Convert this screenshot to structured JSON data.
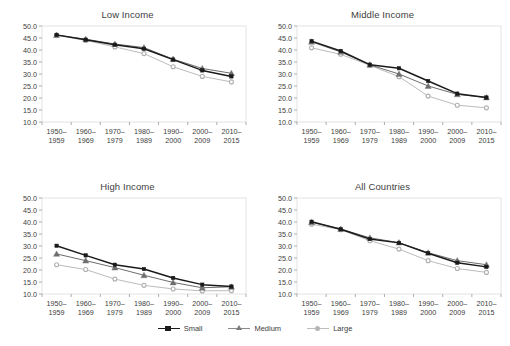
{
  "figure": {
    "panels": [
      "Low Income",
      "Middle Income",
      "High Income",
      "All Countries"
    ]
  },
  "legend": {
    "position": "bottom-center",
    "items": [
      {
        "label": "Small",
        "color": "#1a1a1a",
        "marker": "square"
      },
      {
        "label": "Medium",
        "color": "#808080",
        "marker": "triangle"
      },
      {
        "label": "Large",
        "color": "#b5b5b5",
        "marker": "circle"
      }
    ]
  },
  "chart_data": [
    {
      "type": "line",
      "title": "Low Income",
      "categories": [
        "1950–\n1959",
        "1960–\n1969",
        "1970–\n1979",
        "1980–\n1989",
        "1990–\n2000",
        "2000–\n2009",
        "2010–\n2015"
      ],
      "series": [
        {
          "name": "Small",
          "values": [
            46.3,
            44.3,
            42.2,
            40.5,
            36.0,
            31.5,
            29.0
          ]
        },
        {
          "name": "Medium",
          "values": [
            46.2,
            44.5,
            42.5,
            41.0,
            36.2,
            32.3,
            30.3
          ]
        },
        {
          "name": "Large",
          "values": [
            46.1,
            44.0,
            41.3,
            38.5,
            33.0,
            29.0,
            26.7
          ]
        }
      ],
      "xlabel": "",
      "ylabel": "",
      "ylim": [
        10.0,
        50.0
      ],
      "yticks": [
        "10.0",
        "15.0",
        "20.0",
        "25.0",
        "30.0",
        "35.0",
        "40.0",
        "45.0",
        "50.0"
      ],
      "grid": false,
      "legend": false
    },
    {
      "type": "line",
      "title": "Middle Income",
      "categories": [
        "1950–\n1959",
        "1960–\n1969",
        "1970–\n1979",
        "1980–\n1989",
        "1990–\n2000",
        "2000–\n2009",
        "2010–\n2015"
      ],
      "series": [
        {
          "name": "Small",
          "values": [
            43.7,
            39.6,
            33.9,
            32.4,
            27.1,
            21.8,
            20.2
          ]
        },
        {
          "name": "Medium",
          "values": [
            43.4,
            39.2,
            33.8,
            30.0,
            25.0,
            21.5,
            20.2
          ]
        },
        {
          "name": "Large",
          "values": [
            40.9,
            38.2,
            33.6,
            28.9,
            20.8,
            17.0,
            15.9
          ]
        }
      ],
      "xlabel": "",
      "ylabel": "",
      "ylim": [
        10.0,
        50.0
      ],
      "yticks": [
        "10.0",
        "15.0",
        "20.0",
        "25.0",
        "30.0",
        "35.0",
        "40.0",
        "45.0",
        "50.0"
      ],
      "grid": false,
      "legend": false
    },
    {
      "type": "line",
      "title": "High Income",
      "categories": [
        "1950–\n1959",
        "1960–\n1969",
        "1970–\n1979",
        "1980–\n1989",
        "1990–\n2000",
        "2000–\n2009",
        "2010–\n2015"
      ],
      "series": [
        {
          "name": "Small",
          "values": [
            30.1,
            26.1,
            22.2,
            20.4,
            16.7,
            13.9,
            13.1
          ]
        },
        {
          "name": "Medium",
          "values": [
            26.7,
            23.9,
            21.0,
            17.8,
            14.8,
            12.6,
            13.0
          ]
        },
        {
          "name": "Large",
          "values": [
            22.2,
            20.2,
            16.2,
            13.6,
            12.1,
            11.3,
            11.4
          ]
        }
      ],
      "xlabel": "",
      "ylabel": "",
      "ylim": [
        10.0,
        50.0
      ],
      "yticks": [
        "10.0",
        "15.0",
        "20.0",
        "25.0",
        "30.0",
        "35.0",
        "40.0",
        "45.0",
        "50.0"
      ],
      "grid": false,
      "legend": false
    },
    {
      "type": "line",
      "title": "All Countries",
      "categories": [
        "1950–\n1959",
        "1960–\n1969",
        "1970–\n1979",
        "1980–\n1989",
        "1990–\n2000",
        "2000–\n2009",
        "2010–\n2015"
      ],
      "series": [
        {
          "name": "Small",
          "values": [
            40.1,
            37.0,
            32.9,
            31.3,
            27.0,
            23.0,
            21.3
          ]
        },
        {
          "name": "Medium",
          "values": [
            39.9,
            37.1,
            33.4,
            31.4,
            27.2,
            23.9,
            22.2
          ]
        },
        {
          "name": "Large",
          "values": [
            39.1,
            36.8,
            32.2,
            28.7,
            23.9,
            20.6,
            19.0
          ]
        }
      ],
      "xlabel": "",
      "ylabel": "",
      "ylim": [
        10.0,
        50.0
      ],
      "yticks": [
        "10.0",
        "15.0",
        "20.0",
        "25.0",
        "30.0",
        "35.0",
        "40.0",
        "45.0",
        "50.0"
      ],
      "grid": false,
      "legend": false
    }
  ]
}
